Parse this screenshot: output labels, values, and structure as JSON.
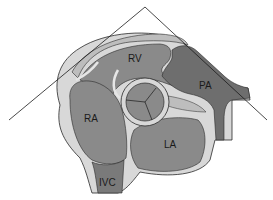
{
  "diagram": {
    "type": "cardiac-anatomy-cross-section",
    "labels": {
      "rv": "RV",
      "ra": "RA",
      "la": "LA",
      "pa": "PA",
      "ivc": "IVC"
    },
    "colors": {
      "background": "#ffffff",
      "chamber": "#8a8a8a",
      "chamber_dark": "#6e6e6e",
      "wall": "#d8d8d8",
      "fat_pad": "#bdbdbd",
      "outline": "#2a2a2a",
      "scan_lines": "#1a1a1a"
    }
  }
}
